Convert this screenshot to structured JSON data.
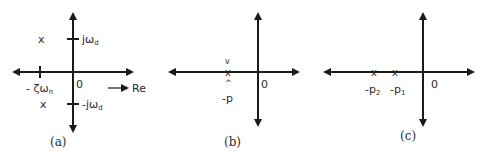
{
  "figure": {
    "panels": [
      {
        "id": "a",
        "caption": "(a)",
        "origin_label": "0",
        "real_tick_label": "- ζω",
        "real_tick_sub": "n",
        "imag_pos_label": "jω",
        "imag_pos_sub": "d",
        "imag_neg_label": "-jω",
        "imag_neg_sub": "d",
        "real_axis_label": "Re",
        "pole_marker": "x",
        "poles": [
          "-ζωn + jωd",
          "-ζωn - jωd"
        ]
      },
      {
        "id": "b",
        "caption": "(b)",
        "origin_label": "0",
        "pole_label": "-p",
        "upper_mark": "v",
        "lower_mark": "^",
        "pole_marker": "x",
        "poles": [
          "-p (double)"
        ]
      },
      {
        "id": "c",
        "caption": "(c)",
        "origin_label": "0",
        "pole2_label": "-p",
        "pole2_sub": "2",
        "pole1_label": "-p",
        "pole1_sub": "1",
        "pole_marker": "x",
        "poles": [
          "-p2",
          "-p1"
        ]
      }
    ]
  }
}
